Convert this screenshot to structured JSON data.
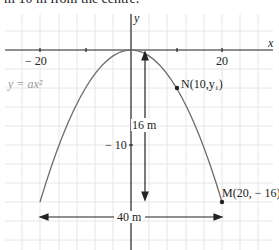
{
  "header": {
    "text": "m 10 m from the centre."
  },
  "axes": {
    "x_label": "x",
    "y_label": "y",
    "x_ticks": [
      {
        "value": -20,
        "label": "− 20"
      },
      {
        "value": 20,
        "label": "20"
      }
    ],
    "y_ticks": [
      {
        "value": -10,
        "label": "− 10"
      }
    ]
  },
  "curve": {
    "equation_label": "y = ax²",
    "color": "#707070"
  },
  "points": {
    "N": {
      "label": "N(10,y₁)",
      "x": 10,
      "y": -4
    },
    "M": {
      "label": "M(20, − 16)",
      "x": 20,
      "y": -16
    }
  },
  "dimensions": {
    "height": {
      "label": "16 m"
    },
    "width": {
      "label": "40 m"
    }
  },
  "colors": {
    "grid": "#e4e4e4",
    "axis": "#222222",
    "curve": "#707070",
    "text": "#222222",
    "equation": "#9a9a9a"
  }
}
